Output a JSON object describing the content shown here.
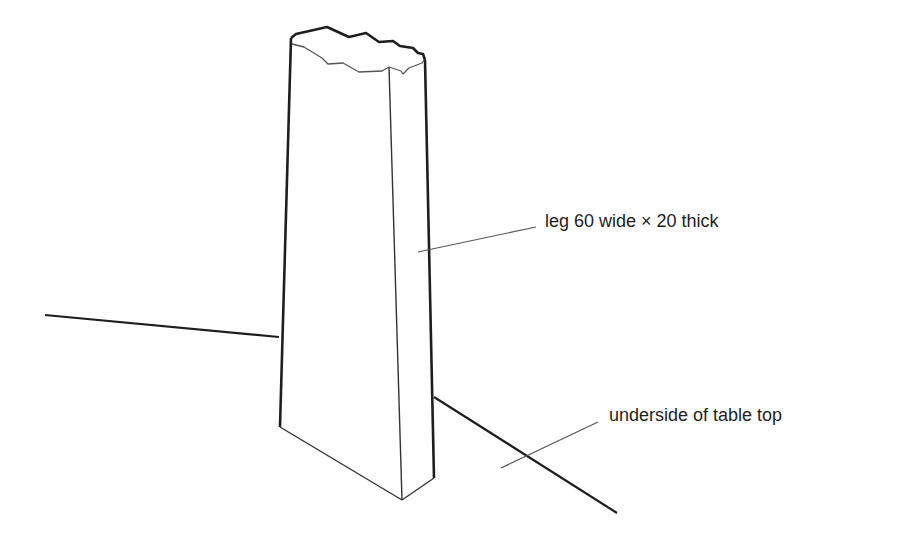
{
  "diagram": {
    "title": "",
    "labels": {
      "leg": "leg 60 wide × 20 thick",
      "table_top": "underside of table top"
    },
    "colors": {
      "background": "#ffffff",
      "outline": "#1e1e1e",
      "leader": "#555555"
    }
  }
}
